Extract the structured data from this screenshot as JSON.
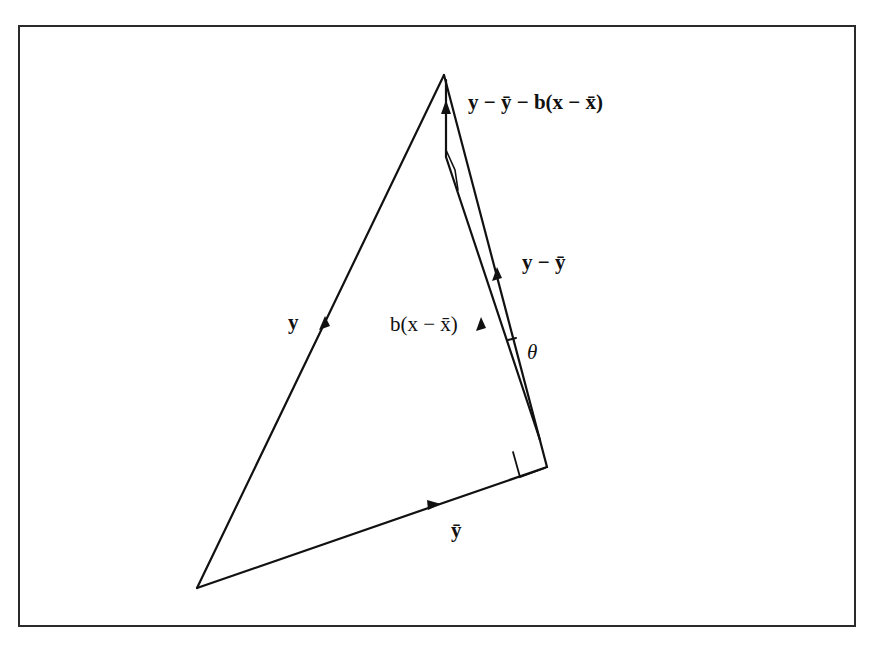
{
  "figure": {
    "labels": {
      "y": "y",
      "y_bar": "ȳ",
      "residual": "y − ȳ − b(x − x̄)",
      "y_minus_ybar": "y − ȳ",
      "b_x_minus_xbar": "b(x − x̄)",
      "theta": "θ"
    },
    "points": {
      "origin": [
        197,
        588
      ],
      "apex": [
        444,
        75
      ],
      "right_corner": [
        547,
        467
      ],
      "fitted_top": [
        446,
        157
      ]
    },
    "colors": {
      "stroke": "#111111",
      "background": "#ffffff"
    }
  }
}
